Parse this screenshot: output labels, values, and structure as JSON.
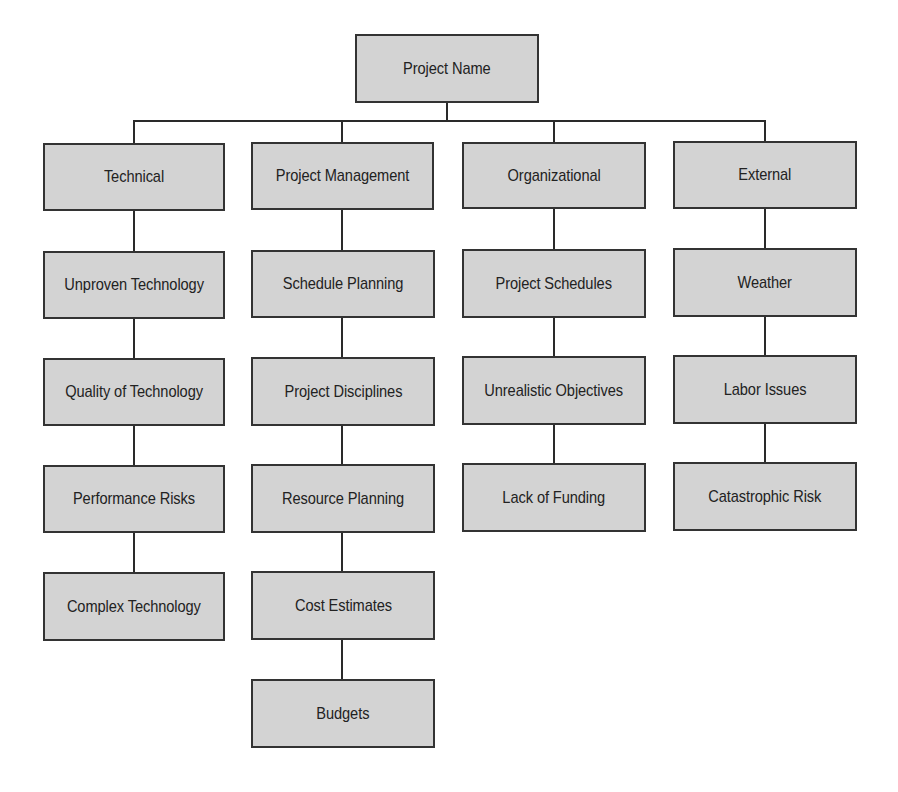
{
  "diagram": {
    "type": "risk-breakdown-structure",
    "root": {
      "label": "Project Name"
    },
    "categories": [
      {
        "label": "Technical",
        "children": [
          "Unproven Technology",
          "Quality of Technology",
          "Performance Risks",
          "Complex Technology"
        ]
      },
      {
        "label": "Project Management",
        "children": [
          "Schedule Planning",
          "Project Disciplines",
          "Resource Planning",
          "Cost Estimates",
          "Budgets"
        ]
      },
      {
        "label": "Organizational",
        "children": [
          "Project Schedules",
          "Unrealistic Objectives",
          "Lack of Funding"
        ]
      },
      {
        "label": "External",
        "children": [
          "Weather",
          "Labor Issues",
          "Catastrophic Risk"
        ]
      }
    ],
    "colors": {
      "box_fill": "#d3d3d3",
      "box_border": "#333333",
      "line": "#2a2a2a",
      "text": "#222222",
      "background": "#ffffff"
    }
  }
}
